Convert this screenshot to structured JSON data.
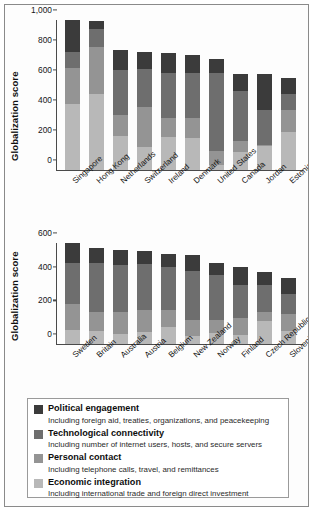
{
  "figure": {
    "ylabel": "Globalization score"
  },
  "legend": {
    "items": [
      {
        "key": "political",
        "title": "Political engagement",
        "subtitle": "Including foreign aid, treaties, organizations, and peacekeeping",
        "color": "#3b3b3b"
      },
      {
        "key": "technological",
        "title": "Technological connectivity",
        "subtitle": "Including number of internet users, hosts, and secure servers",
        "color": "#6e6e6e"
      },
      {
        "key": "personal",
        "title": "Personal contact",
        "subtitle": "Including telephone calls, travel, and remittances",
        "color": "#949494",
        "_note": "swatch shade between technological and economic"
      },
      {
        "key": "economic",
        "title": "Economic integration",
        "subtitle": "Including international trade and foreign direct investment",
        "color": "#b8b8b8"
      }
    ]
  },
  "chart_data": [
    {
      "id": "top",
      "type": "bar",
      "stacked": true,
      "title": "",
      "xlabel": "",
      "ylabel": "Globalization score",
      "ylim": [
        0,
        1000
      ],
      "yticks": [
        0,
        200,
        400,
        600,
        800,
        1000
      ],
      "ytick_labels": [
        "0",
        "200",
        "400",
        "600",
        "800",
        "1,000"
      ],
      "grid": false,
      "legend_position": "below-figure",
      "categories": [
        "Singapore",
        "Hong Kong",
        "Netherlands",
        "Switzerland",
        "Ireland",
        "Denmark",
        "United States",
        "Canada",
        "Jordan",
        "Estonia"
      ],
      "series": [
        {
          "name": "Economic integration",
          "color": "#b8b8b8",
          "values": [
            440,
            505,
            230,
            155,
            220,
            215,
            35,
            120,
            160,
            255
          ]
        },
        {
          "name": "Personal contact",
          "color": "#949494",
          "values": [
            240,
            315,
            140,
            265,
            130,
            130,
            95,
            75,
            10,
            145
          ]
        },
        {
          "name": "Technological connectivity",
          "color": "#6e6e6e",
          "values": [
            110,
            120,
            295,
            255,
            300,
            305,
            520,
            330,
            230,
            105
          ]
        },
        {
          "name": "Political engagement",
          "color": "#3b3b3b",
          "values": [
            210,
            55,
            135,
            110,
            130,
            115,
            90,
            115,
            238,
            107
          ]
        }
      ],
      "totals": [
        1000,
        995,
        800,
        785,
        780,
        765,
        740,
        640,
        638,
        612
      ]
    },
    {
      "id": "bottom",
      "type": "bar",
      "stacked": true,
      "title": "",
      "xlabel": "",
      "ylabel": "Globalization score",
      "ylim": [
        0,
        600
      ],
      "yticks": [
        0,
        200,
        400,
        600
      ],
      "ytick_labels": [
        "0",
        "200",
        "400",
        "600"
      ],
      "grid": false,
      "legend_position": "below-figure",
      "categories": [
        "Sweden",
        "Britain",
        "Australia",
        "Austria",
        "Belgium",
        "New Zealand",
        "Norway",
        "Finland",
        "Czech Republic",
        "Slovenia"
      ],
      "series": [
        {
          "name": "Economic integration",
          "color": "#b8b8b8",
          "values": [
            85,
            75,
            60,
            70,
            100,
            45,
            65,
            55,
            135,
            80
          ]
        },
        {
          "name": "Personal contact",
          "color": "#949494",
          "values": [
            155,
            115,
            130,
            130,
            105,
            95,
            75,
            100,
            55,
            100
          ]
        },
        {
          "name": "Technological connectivity",
          "color": "#6e6e6e",
          "values": [
            240,
            290,
            280,
            275,
            250,
            295,
            270,
            195,
            160,
            115
          ]
        },
        {
          "name": "Political engagement",
          "color": "#3b3b3b",
          "values": [
            118,
            90,
            90,
            75,
            78,
            93,
            70,
            105,
            78,
            95
          ]
        }
      ],
      "totals": [
        598,
        570,
        560,
        550,
        533,
        528,
        480,
        455,
        428,
        390
      ]
    }
  ]
}
